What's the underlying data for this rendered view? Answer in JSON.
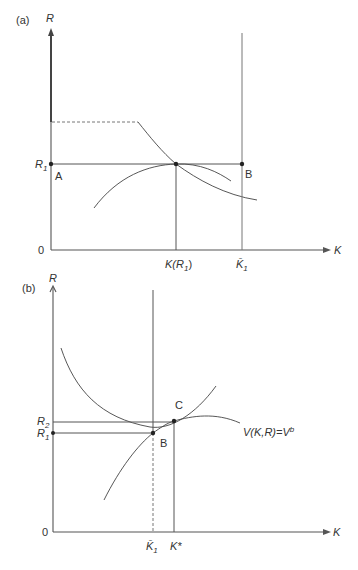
{
  "panel_a": {
    "tag": "(a)",
    "y_axis_label": "R",
    "x_axis_label": "K",
    "origin_label": "0",
    "r1_label": "R",
    "r1_sub": "1",
    "point_a_label": "A",
    "point_b_label": "B",
    "k_r1_label": "K(R",
    "k_r1_sub": "1",
    "k_r1_close": ")",
    "k1bar_label": "K̄",
    "k1bar_sub": "1"
  },
  "panel_b": {
    "tag": "(b)",
    "y_axis_label": "R",
    "x_axis_label": "K",
    "origin_label": "0",
    "r1_label": "R",
    "r1_sub": "1",
    "r2_label": "R",
    "r2_sub": "2",
    "point_b_label": "B",
    "point_c_label": "C",
    "k1bar_label": "K̄",
    "k1bar_sub": "1",
    "kstar_label": "K*",
    "curve_label": "V(K,R)=V",
    "curve_sup": "b"
  }
}
